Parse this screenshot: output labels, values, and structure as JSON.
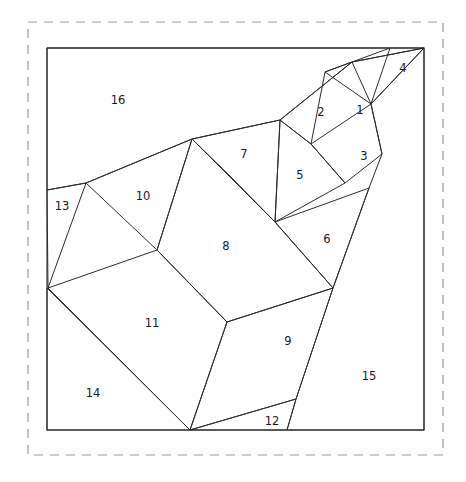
{
  "figure": {
    "background_color": "#ffffff",
    "line_color": "#2b2b2b",
    "frame_color": "#9a9a9a",
    "outline_color": "#4a4a4a",
    "dashed_frame": {
      "x": 28,
      "y": 22,
      "width": 415,
      "height": 433
    },
    "square": {
      "x": 47,
      "y": 48,
      "width": 377,
      "height": 382
    }
  },
  "chart_data": {
    "type": "diagram",
    "piece_count": 16,
    "labels": [
      "1",
      "2",
      "3",
      "4",
      "5",
      "6",
      "7",
      "8",
      "9",
      "10",
      "11",
      "12",
      "13",
      "14",
      "15",
      "16"
    ],
    "pieces": [
      {
        "id": "1",
        "label": "1",
        "label_x": 360,
        "label_y": 110,
        "points": "325,72 352,62 390,48 371,104"
      },
      {
        "id": "2",
        "label": "2",
        "label_x": 321,
        "label_y": 112,
        "points": "280,120 352,62 325,72 311,144"
      },
      {
        "id": "3",
        "label": "3",
        "label_x": 364,
        "label_y": 156,
        "points": "311,144 371,104 382,154 345,183"
      },
      {
        "id": "4",
        "label": "4",
        "label_x": 403,
        "label_y": 68,
        "points": "352,62 424,48 371,104"
      },
      {
        "id": "5",
        "label": "5",
        "label_x": 300,
        "label_y": 175,
        "points": "280,120 311,144 345,183 275,222"
      },
      {
        "id": "6",
        "label": "6",
        "label_x": 327,
        "label_y": 239,
        "points": "275,222 369,188 333,288"
      },
      {
        "id": "7",
        "label": "7",
        "label_x": 244,
        "label_y": 154,
        "points": "192,139 280,120 275,222 230,176"
      },
      {
        "id": "8",
        "label": "8",
        "label_x": 226,
        "label_y": 246,
        "points": "192,139 275,222 333,288 227,322 157,250"
      },
      {
        "id": "9",
        "label": "9",
        "label_x": 288,
        "label_y": 341,
        "points": "227,322 333,288 296,399 190,430"
      },
      {
        "id": "10",
        "label": "10",
        "label_x": 143,
        "label_y": 196,
        "points": "86,183 192,139 157,250"
      },
      {
        "id": "11",
        "label": "11",
        "label_x": 152,
        "label_y": 323,
        "points": "48,288 157,250 227,322 190,430"
      },
      {
        "id": "12",
        "label": "12",
        "label_x": 272,
        "label_y": 421,
        "points": "190,430 296,399 287,430"
      },
      {
        "id": "13",
        "label": "13",
        "label_x": 62,
        "label_y": 206,
        "points": "47,190 86,183 48,288"
      },
      {
        "id": "14",
        "label": "14",
        "label_x": 93,
        "label_y": 393,
        "points": "47,288 190,430 47,430"
      },
      {
        "id": "15",
        "label": "15",
        "label_x": 369,
        "label_y": 376,
        "points": "424,48 424,430 287,430 296,399 333,288 369,188 382,154 371,104"
      },
      {
        "id": "16",
        "label": "16",
        "label_x": 118,
        "label_y": 100,
        "points": "47,48 424,48 352,62 280,120 192,139 86,183 47,190"
      }
    ],
    "outer_square_corners": [
      {
        "name": "top-left",
        "x": 47,
        "y": 48
      },
      {
        "name": "top-right",
        "x": 424,
        "y": 48
      },
      {
        "name": "bottom-right",
        "x": 424,
        "y": 430
      },
      {
        "name": "bottom-left",
        "x": 47,
        "y": 430
      }
    ]
  }
}
